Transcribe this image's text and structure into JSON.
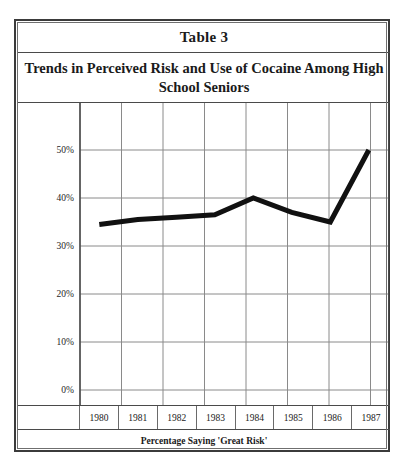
{
  "caption": "Table 3",
  "title": "Trends in Perceived Risk and Use of Cocaine Among High School Seniors",
  "footer": "Percentage Saying 'Great Risk'",
  "axis": {
    "y_ticks": [
      "0%",
      "10%",
      "20%",
      "30%",
      "40%",
      "50%"
    ],
    "x_ticks": [
      "1980",
      "1981",
      "1982",
      "1983",
      "1984",
      "1985",
      "1986",
      "1987"
    ]
  },
  "colors": {
    "line": "#111111",
    "grid": "#8a8a8a",
    "frame": "#3b3b3b",
    "text": "#1a1a1a",
    "background": "#ffffff"
  },
  "chart_data": {
    "type": "line",
    "title": "Trends in Perceived Risk and Use of Cocaine Among High School Seniors",
    "subtitle": "Table 3",
    "xlabel": "Percentage Saying 'Great Risk'",
    "ylabel": "",
    "categories": [
      "1980",
      "1981",
      "1982",
      "1983",
      "1984",
      "1985",
      "1986",
      "1987"
    ],
    "values": [
      34.5,
      35.5,
      36,
      36.5,
      40,
      37,
      35,
      50
    ],
    "series": [
      {
        "name": "Percentage Saying 'Great Risk'",
        "values": [
          34.5,
          35.5,
          36,
          36.5,
          40,
          37,
          35,
          50
        ]
      }
    ],
    "ylim": [
      0,
      55
    ],
    "ytick_values": [
      0,
      10,
      20,
      30,
      40,
      50
    ],
    "ytick_labels": [
      "0%",
      "10%",
      "20%",
      "30%",
      "40%",
      "50%"
    ],
    "grid": true,
    "legend": "none",
    "line_width": 5,
    "line_color": "#111111"
  }
}
